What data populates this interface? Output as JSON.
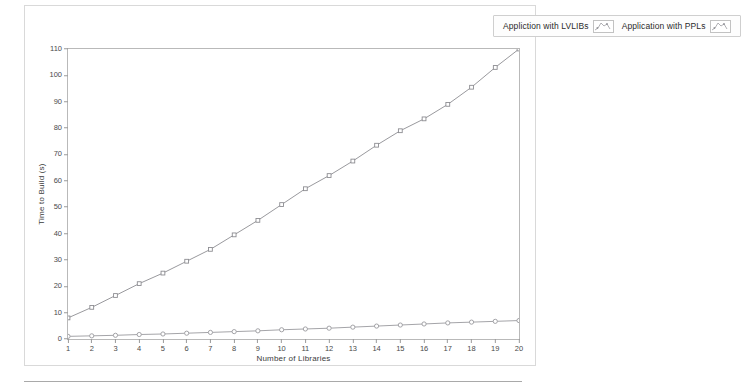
{
  "legend": {
    "position": "top-right",
    "entries": [
      {
        "label": "Appliction with LVLIBs",
        "icon": "line-plot-icon",
        "color": "#8d8d92"
      },
      {
        "label": "Application with PPLs",
        "icon": "line-plot-icon",
        "color": "#8d8d92"
      }
    ]
  },
  "axes": {
    "y_title": "Time to Build (s)",
    "x_title": "Number of Libraries",
    "y_ticks": [
      0,
      10,
      20,
      30,
      40,
      50,
      60,
      70,
      80,
      90,
      100,
      110
    ],
    "x_ticks": [
      1,
      2,
      3,
      4,
      5,
      6,
      7,
      8,
      9,
      10,
      11,
      12,
      13,
      14,
      15,
      16,
      17,
      18,
      19,
      20
    ]
  },
  "chart_data": {
    "type": "line",
    "title": "",
    "xlabel": "Number of Libraries",
    "ylabel": "Time to Build (s)",
    "xlim": [
      1,
      20
    ],
    "ylim": [
      0,
      110
    ],
    "grid": false,
    "legend_position": "top-right",
    "x": [
      1,
      2,
      3,
      4,
      5,
      6,
      7,
      8,
      9,
      10,
      11,
      12,
      13,
      14,
      15,
      16,
      17,
      18,
      19,
      20
    ],
    "series": [
      {
        "name": "Appliction with LVLIBs",
        "color": "#8d8d92",
        "marker": "square",
        "values": [
          8,
          12,
          16.5,
          21,
          25,
          29.5,
          34,
          39.5,
          45,
          51,
          57,
          62,
          67.5,
          73.5,
          79,
          83.5,
          89,
          95.5,
          103,
          110
        ]
      },
      {
        "name": "Application with PPLs",
        "color": "#9a9a9e",
        "marker": "circle",
        "values": [
          1,
          1.2,
          1.4,
          1.7,
          1.9,
          2.2,
          2.5,
          2.8,
          3.1,
          3.5,
          3.8,
          4.1,
          4.5,
          4.9,
          5.3,
          5.7,
          6.1,
          6.4,
          6.7,
          7
        ]
      }
    ]
  }
}
